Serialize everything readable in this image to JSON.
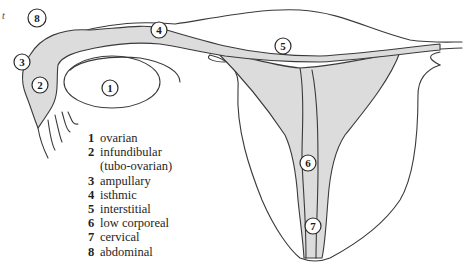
{
  "figure": {
    "corner_mark": "t",
    "colors": {
      "line": "#3a3a3a",
      "shade": "#dcdcdc",
      "background": "#ffffff"
    }
  },
  "markers": [
    {
      "num": "1",
      "label": "ovarian",
      "x": 110,
      "y": 88
    },
    {
      "num": "2",
      "label": "infundibular (tubo-ovarian)",
      "x": 40,
      "y": 85
    },
    {
      "num": "3",
      "label": "ampullary",
      "x": 22,
      "y": 62
    },
    {
      "num": "4",
      "label": "isthmic",
      "x": 159,
      "y": 30
    },
    {
      "num": "5",
      "label": "interstitial",
      "x": 283,
      "y": 46
    },
    {
      "num": "6",
      "label": "low corporeal",
      "x": 308,
      "y": 163
    },
    {
      "num": "7",
      "label": "cervical",
      "x": 313,
      "y": 226
    },
    {
      "num": "8",
      "label": "abdominal",
      "x": 37,
      "y": 18
    }
  ],
  "legend": [
    {
      "num": "1",
      "label": "ovarian"
    },
    {
      "num": "2",
      "label": "infundibular",
      "continuation": "(tubo-ovarian)"
    },
    {
      "num": "3",
      "label": "ampullary"
    },
    {
      "num": "4",
      "label": "isthmic"
    },
    {
      "num": "5",
      "label": "interstitial"
    },
    {
      "num": "6",
      "label": "low corporeal"
    },
    {
      "num": "7",
      "label": "cervical"
    },
    {
      "num": "8",
      "label": "abdominal"
    }
  ]
}
